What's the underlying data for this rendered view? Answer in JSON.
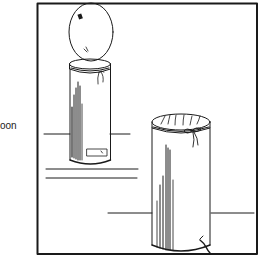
{
  "figure": {
    "side_label": "oon",
    "colors": {
      "ink": "#1a1a1a",
      "paper": "#ffffff"
    },
    "frame": {
      "x": 37,
      "y": 3,
      "width": 220,
      "height": 251
    },
    "objects": [
      {
        "name": "left-container-with-balloon",
        "label_box": true
      },
      {
        "name": "right-container-with-covered-top"
      }
    ]
  }
}
